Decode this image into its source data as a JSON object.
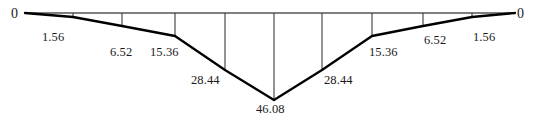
{
  "figure": {
    "type": "bending-moment-diagram",
    "background_color": "#ffffff",
    "curve_color": "#000000",
    "axis_color": "#000000",
    "ordinate_color": "#3a3a3a",
    "text_color": "#1a1a1a"
  },
  "labels": {
    "left_end": "0",
    "right_end": "0",
    "v1": "1.56",
    "v2": "6.52",
    "v3": "15.36",
    "v4": "28.44",
    "v5": "46.08",
    "v6": "28.44",
    "v7": "15.36",
    "v8": "6.52",
    "v9": "1.56"
  },
  "chart_data": {
    "type": "line",
    "title": "",
    "xlabel": "",
    "ylabel": "",
    "grid": false,
    "legend": null,
    "orientation": "values-plotted-downward-from-baseline",
    "baseline_y_px": 13,
    "x_start_px": 25,
    "x_end_px": 515,
    "xlim": [
      0,
      10
    ],
    "ylim": [
      0,
      46.08
    ],
    "x": [
      0,
      1,
      2,
      3,
      4,
      5,
      6,
      7,
      8,
      9,
      10
    ],
    "x_px": [
      25,
      73,
      122,
      175,
      225,
      274,
      322,
      372,
      423,
      472,
      515
    ],
    "values": [
      0,
      1.56,
      6.52,
      15.36,
      28.44,
      46.08,
      28.44,
      15.36,
      6.52,
      1.56,
      0
    ],
    "tick_labels": [
      "0",
      "1.56",
      "6.52",
      "15.36",
      "28.44",
      "46.08",
      "28.44",
      "15.36",
      "6.52",
      "1.56",
      "0"
    ],
    "ordinates_px": [
      {
        "x": 73,
        "y_top": 13,
        "y_bottom": 17
      },
      {
        "x": 122,
        "y_top": 13,
        "y_bottom": 26
      },
      {
        "x": 175,
        "y_top": 13,
        "y_bottom": 36
      },
      {
        "x": 225,
        "y_top": 13,
        "y_bottom": 70
      },
      {
        "x": 274,
        "y_top": 13,
        "y_bottom": 100
      },
      {
        "x": 322,
        "y_top": 13,
        "y_bottom": 70
      },
      {
        "x": 372,
        "y_top": 13,
        "y_bottom": 36
      },
      {
        "x": 423,
        "y_top": 13,
        "y_bottom": 26
      },
      {
        "x": 472,
        "y_top": 13,
        "y_bottom": 17
      }
    ],
    "curve_points_px": [
      {
        "x": 25,
        "y": 13
      },
      {
        "x": 73,
        "y": 17
      },
      {
        "x": 122,
        "y": 26
      },
      {
        "x": 175,
        "y": 36
      },
      {
        "x": 225,
        "y": 70
      },
      {
        "x": 274,
        "y": 100
      },
      {
        "x": 322,
        "y": 70
      },
      {
        "x": 372,
        "y": 36
      },
      {
        "x": 423,
        "y": 26
      },
      {
        "x": 472,
        "y": 17
      },
      {
        "x": 515,
        "y": 13
      }
    ]
  }
}
